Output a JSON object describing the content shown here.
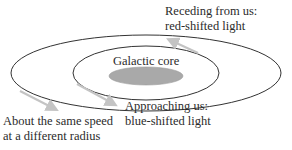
{
  "diagram": {
    "labels": {
      "receding_line1": "Receding from us:",
      "receding_line2": "red-shifted light",
      "core": "Galactic core",
      "approaching_line1": "Approaching us:",
      "approaching_line2": "blue-shifted light",
      "same_speed_line1": "About the same speed",
      "same_speed_line2": "at a different radius"
    },
    "colors": {
      "orbit_stroke": "#333333",
      "core_fill": "#a9a9a9",
      "arrow": "#c4c4c4",
      "text": "#2b2b2b"
    }
  }
}
